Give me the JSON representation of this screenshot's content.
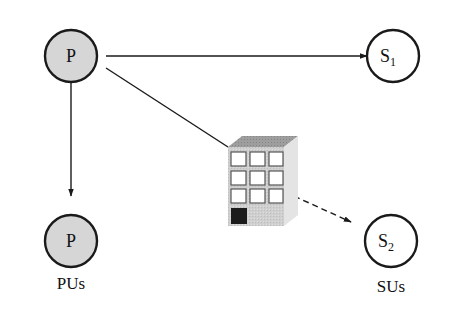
{
  "diagram": {
    "type": "network-topology",
    "colors": {
      "primary_fill": "#d6d6d6",
      "secondary_fill": "#ffffff",
      "stroke": "#1a1a1a",
      "building_front": "#cfcfcf",
      "building_top": "#9a9a9a",
      "building_side": "#e4e4e4",
      "door": "#1c1c1c"
    },
    "nodes": {
      "pu_tx": {
        "label": "P",
        "role": "primary-transmitter"
      },
      "pu_rx": {
        "label": "P",
        "role": "primary-receiver"
      },
      "su_1": {
        "label": "S",
        "subscript": "1",
        "role": "secondary-user-1"
      },
      "su_2": {
        "label": "S",
        "subscript": "2",
        "role": "secondary-user-2"
      },
      "obstacle": {
        "label": "",
        "role": "building"
      }
    },
    "edges": [
      {
        "from": "pu_tx",
        "to": "su_1",
        "style": "solid",
        "arrow": true
      },
      {
        "from": "pu_tx",
        "to": "pu_rx",
        "style": "solid",
        "arrow": true
      },
      {
        "from": "pu_tx",
        "to": "obstacle",
        "style": "solid",
        "arrow": false
      },
      {
        "from": "obstacle",
        "to": "su_2",
        "style": "dashed",
        "arrow": true
      }
    ],
    "captions": {
      "primary_group": "PUs",
      "secondary_group": "SUs"
    }
  }
}
